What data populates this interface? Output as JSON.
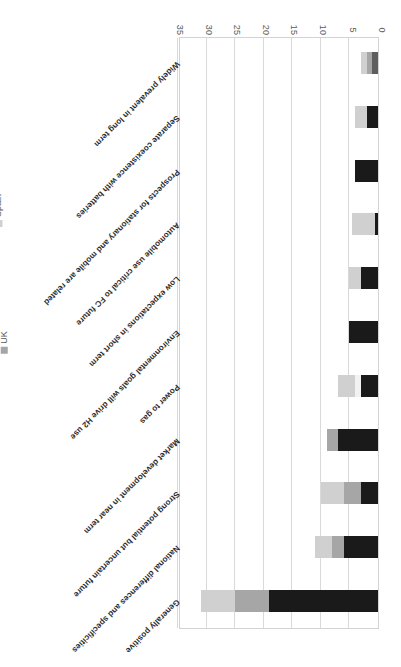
{
  "chart_data": {
    "type": "bar",
    "orientation": "horizontal-stacked",
    "title": "",
    "subtitle": "",
    "xlabel": "",
    "ylabel": "",
    "xlim": [
      0,
      35
    ],
    "grid": true,
    "rotated_180": true,
    "legend_position": "bottom",
    "axis_ticks": [
      "0",
      "5",
      "10",
      "15",
      "20",
      "25",
      "30",
      "35"
    ],
    "tick_values": [
      0,
      5,
      10,
      15,
      20,
      25,
      30,
      35
    ],
    "categories": [
      "Generally positive",
      "National differences and specificities",
      "Strong potential but uncertain future",
      "Market development in near term",
      "Power to gas",
      "Environmental goals will drive H2 use",
      "Low expectations in short term",
      "Automobile use critical to FC future",
      "Prospects for stationary and mobile are related",
      "Separate coexistence with batteries",
      "Widely prevalent in long term"
    ],
    "series": [
      {
        "name": "France",
        "color": "#1a1a1a",
        "values": [
          19,
          6,
          3,
          7,
          3,
          5,
          3,
          0.5,
          4,
          2,
          0
        ]
      },
      {
        "name": "Slovenia",
        "color": "#5e5e5e",
        "values": [
          0,
          0,
          0,
          0,
          0,
          0,
          0,
          0,
          0,
          0,
          1
        ]
      },
      {
        "name": "UK",
        "color": "#a6a6a6",
        "values": [
          6,
          2,
          3,
          2,
          0,
          0,
          0,
          0,
          0,
          0,
          1
        ]
      },
      {
        "name": "Germany",
        "color": "#f2f2f2",
        "values": [
          0,
          0,
          0,
          0,
          1,
          0,
          0,
          0,
          0,
          0,
          0
        ]
      },
      {
        "name": "Spain",
        "color": "#d0d0d0",
        "values": [
          6,
          3,
          4,
          0,
          3,
          0,
          2,
          4,
          0,
          2,
          1
        ]
      }
    ],
    "totals": [
      31,
      11,
      10,
      9,
      7,
      5,
      5,
      4.5,
      4,
      4,
      3
    ]
  },
  "legend": {
    "entries": [
      {
        "label": "France",
        "color": "#1a1a1a"
      },
      {
        "label": "Slovenia",
        "color": "#5e5e5e"
      },
      {
        "label": "UK",
        "color": "#a6a6a6"
      },
      {
        "label": "Germany",
        "color": "#f2f2f2"
      },
      {
        "label": "Spain",
        "color": "#d0d0d0"
      }
    ]
  },
  "axis": {
    "tick_labels": [
      "0",
      "5",
      "10",
      "15",
      "20",
      "25",
      "30",
      "35"
    ]
  },
  "categories": {
    "labels": [
      "Generally positive",
      "National differences and specificities",
      "Strong potential but uncertain future",
      "Market development in near term",
      "Power to gas",
      "Environmental goals will drive H2 use",
      "Low expectations in short term",
      "Automobile use critical to FC future",
      "Prospects for stationary and mobile are related",
      "Separate coexistence with batteries",
      "Widely prevalent in long term"
    ]
  }
}
